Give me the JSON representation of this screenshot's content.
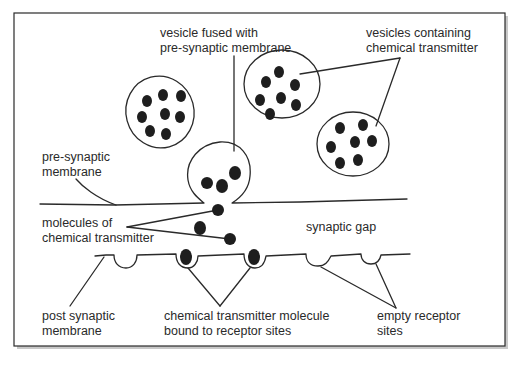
{
  "diagram": {
    "labels": {
      "vesicle_fused": [
        "vesicle fused with",
        "pre-synaptic membrane"
      ],
      "vesicles_containing": [
        "vesicles containing",
        "chemical transmitter"
      ],
      "pre_synaptic_membrane": [
        "pre-synaptic",
        "membrane"
      ],
      "molecules_of_transmitter": [
        "molecules of",
        "chemical transmitter"
      ],
      "synaptic_gap": [
        "synaptic gap"
      ],
      "post_synaptic_membrane": [
        "post synaptic",
        "membrane"
      ],
      "bound_transmitter": [
        "chemical transmitter molecule",
        "bound to receptor sites"
      ],
      "empty_receptor_sites": [
        "empty receptor",
        "sites"
      ]
    },
    "colors": {
      "ink": "#2a2a2a",
      "frame_shadow": "#bdbdbd",
      "background": "#ffffff"
    }
  }
}
